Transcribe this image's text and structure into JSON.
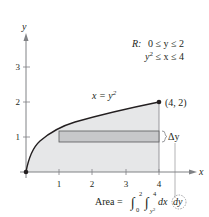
{
  "diagram": {
    "axes": {
      "x_label": "x",
      "y_label": "y",
      "x_ticks": [
        "1",
        "2",
        "3",
        "4"
      ],
      "y_ticks": [
        "1",
        "2",
        "3"
      ]
    },
    "curve": {
      "equation_lhs": "x = y",
      "equation_exp": "2"
    },
    "point": {
      "label": "(4, 2)"
    },
    "region": {
      "label": "R:",
      "line1": "0 ≤ y ≤ 2",
      "line2_base": "y",
      "line2_exp": "2",
      "line2_rest": " ≤ x ≤ 4"
    },
    "strip": {
      "delta_label": "Δy"
    },
    "area_formula": {
      "prefix": "Area =",
      "outer_lower": "0",
      "outer_upper": "2",
      "inner_lower_base": "y",
      "inner_lower_exp": "2",
      "inner_upper": "4",
      "integrand": "dx",
      "differential": "dy"
    },
    "colors": {
      "region_fill": "#e6e7e8",
      "strip_fill": "#c7c8ca",
      "axis": "#808285",
      "curve": "#231f20",
      "text": "#231f20"
    }
  }
}
